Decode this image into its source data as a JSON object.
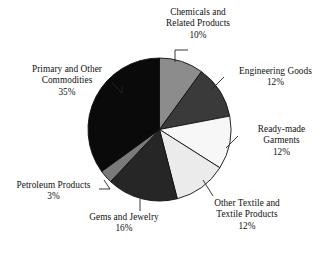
{
  "chart_data": {
    "type": "pie",
    "title": "",
    "subtitle": "",
    "xlabel": "",
    "ylabel": "",
    "legend_position": "none",
    "grid": false,
    "labels_show_percent": true,
    "start_angle_deg": 0,
    "direction": "clockwise",
    "categories": [
      "Chemicals and Related Products",
      "Engineering Goods",
      "Ready-made Garments",
      "Other Textile and Textile Products",
      "Gems and Jewelry",
      "Petroleum Products",
      "Primary and Other Commodities"
    ],
    "values": [
      10,
      12,
      12,
      12,
      16,
      3,
      35
    ],
    "value_labels": [
      "10%",
      "12%",
      "12%",
      "12%",
      "16%",
      "3%",
      "35%"
    ],
    "colors": [
      "#8c8c8c",
      "#3a3a3a",
      "#f7f7f7",
      "#ebebeb",
      "#262626",
      "#7a7a7a",
      "#0a0a0a"
    ],
    "slice_outline_color": "#111111"
  },
  "labels": {
    "chemicals": {
      "line1": "Chemicals and",
      "line2": "Related Products",
      "value": "10%"
    },
    "engineering": {
      "line1": "Engineering Goods",
      "value": "12%"
    },
    "readymade": {
      "line1": "Ready-made",
      "line2": "Garments",
      "value": "12%"
    },
    "othertextile": {
      "line1": "Other Textile and",
      "line2": "Textile Products",
      "value": "12%"
    },
    "gems": {
      "line1": "Gems and Jewelry",
      "value": "16%"
    },
    "petroleum": {
      "line1": "Petroleum Products",
      "value": "3%"
    },
    "primary": {
      "line1": "Primary and Other",
      "line2": "Commodities",
      "value": "35%"
    }
  }
}
